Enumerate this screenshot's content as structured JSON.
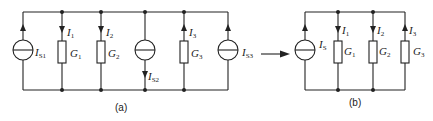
{
  "figure": {
    "circuit_a": {
      "caption": "(a)",
      "sources": [
        {
          "id": "Is1",
          "label": "I",
          "sub": "S1",
          "direction": "up"
        },
        {
          "id": "Is2",
          "label": "I",
          "sub": "S2",
          "direction": "down"
        },
        {
          "id": "Is3",
          "label": "I",
          "sub": "S3",
          "direction": "up"
        }
      ],
      "conductances": [
        {
          "id": "G1",
          "label": "G",
          "sub": "1",
          "current": "I",
          "current_sub": "1",
          "current_direction": "down"
        },
        {
          "id": "G2",
          "label": "G",
          "sub": "2",
          "current": "I",
          "current_sub": "2",
          "current_direction": "down"
        },
        {
          "id": "G3",
          "label": "G",
          "sub": "3",
          "current": "I",
          "current_sub": "3",
          "current_direction": "up"
        }
      ]
    },
    "transform_arrow": "→",
    "circuit_b": {
      "caption": "(b)",
      "sources": [
        {
          "id": "Is",
          "label": "I",
          "sub": "S",
          "direction": "up"
        }
      ],
      "conductances": [
        {
          "id": "G1",
          "label": "G",
          "sub": "1",
          "current": "I",
          "current_sub": "1",
          "current_direction": "down"
        },
        {
          "id": "G2",
          "label": "G",
          "sub": "2",
          "current": "I",
          "current_sub": "2",
          "current_direction": "down"
        },
        {
          "id": "G3",
          "label": "G",
          "sub": "3",
          "current": "I",
          "current_sub": "3",
          "current_direction": "up"
        }
      ]
    }
  }
}
